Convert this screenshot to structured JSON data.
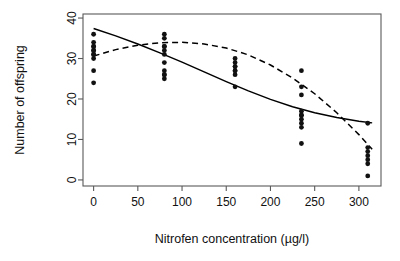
{
  "chart_data": {
    "type": "scatter",
    "title": "",
    "xlabel": "Nitrofen concentration (µg/l)",
    "ylabel": "Number of offspring",
    "xlim": [
      -12,
      325
    ],
    "ylim": [
      -1.5,
      41
    ],
    "xticks": [
      0,
      50,
      100,
      150,
      200,
      250,
      300
    ],
    "xticklabels": [
      "0",
      "50",
      "100",
      "150",
      "200",
      "250",
      "300"
    ],
    "yticks": [
      0,
      10,
      20,
      30,
      40
    ],
    "yticklabels": [
      "0",
      "10",
      "20",
      "30",
      "40"
    ],
    "grid": false,
    "legend": "none",
    "points": [
      {
        "x": 0,
        "y": 36
      },
      {
        "x": 0,
        "y": 34
      },
      {
        "x": 0,
        "y": 33
      },
      {
        "x": 0,
        "y": 33
      },
      {
        "x": 0,
        "y": 32
      },
      {
        "x": 0,
        "y": 32
      },
      {
        "x": 0,
        "y": 31
      },
      {
        "x": 0,
        "y": 31
      },
      {
        "x": 0,
        "y": 30
      },
      {
        "x": 0,
        "y": 27
      },
      {
        "x": 0,
        "y": 24
      },
      {
        "x": 80,
        "y": 36
      },
      {
        "x": 80,
        "y": 35
      },
      {
        "x": 80,
        "y": 33
      },
      {
        "x": 80,
        "y": 33
      },
      {
        "x": 80,
        "y": 32
      },
      {
        "x": 80,
        "y": 31
      },
      {
        "x": 80,
        "y": 29
      },
      {
        "x": 80,
        "y": 27
      },
      {
        "x": 80,
        "y": 26
      },
      {
        "x": 80,
        "y": 26
      },
      {
        "x": 80,
        "y": 25
      },
      {
        "x": 160,
        "y": 30
      },
      {
        "x": 160,
        "y": 29
      },
      {
        "x": 160,
        "y": 28
      },
      {
        "x": 160,
        "y": 28
      },
      {
        "x": 160,
        "y": 27
      },
      {
        "x": 160,
        "y": 27
      },
      {
        "x": 160,
        "y": 26
      },
      {
        "x": 160,
        "y": 23
      },
      {
        "x": 235,
        "y": 27
      },
      {
        "x": 235,
        "y": 23
      },
      {
        "x": 235,
        "y": 21
      },
      {
        "x": 235,
        "y": 17
      },
      {
        "x": 235,
        "y": 16
      },
      {
        "x": 235,
        "y": 16
      },
      {
        "x": 235,
        "y": 15
      },
      {
        "x": 235,
        "y": 14
      },
      {
        "x": 235,
        "y": 13
      },
      {
        "x": 235,
        "y": 9
      },
      {
        "x": 310,
        "y": 14
      },
      {
        "x": 310,
        "y": 8
      },
      {
        "x": 310,
        "y": 7
      },
      {
        "x": 310,
        "y": 6
      },
      {
        "x": 310,
        "y": 5
      },
      {
        "x": 310,
        "y": 4
      },
      {
        "x": 310,
        "y": 1
      }
    ],
    "series": [
      {
        "name": "solid-fit",
        "style": "solid",
        "x": [
          0,
          25,
          50,
          75,
          100,
          125,
          150,
          175,
          200,
          225,
          250,
          275,
          300,
          315
        ],
        "y": [
          37.4,
          35.6,
          33.6,
          31.4,
          29.1,
          26.7,
          24.3,
          22.0,
          19.9,
          18.1,
          16.6,
          15.4,
          14.5,
          14.1
        ]
      },
      {
        "name": "dashed-fit",
        "style": "dashed",
        "x": [
          0,
          25,
          50,
          75,
          100,
          125,
          150,
          175,
          200,
          225,
          250,
          275,
          300,
          315
        ],
        "y": [
          30.6,
          32.2,
          33.3,
          33.9,
          34.0,
          33.6,
          32.6,
          30.9,
          28.4,
          25.2,
          21.3,
          16.6,
          11.2,
          7.6
        ]
      }
    ]
  }
}
